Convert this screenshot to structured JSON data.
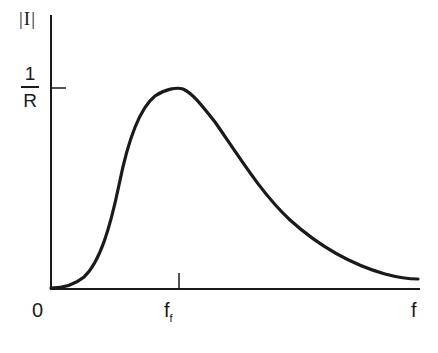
{
  "diagram": {
    "y_axis_label": "|I|",
    "y_tick_label": {
      "numerator": "1",
      "denominator": "R"
    },
    "x_origin_label": "0",
    "x_tick_label": {
      "base": "f",
      "subscript": "f"
    },
    "x_axis_label": "f",
    "curve_description": "Resonance curve: current magnitude vs frequency, peaking at 1/R at f = f_f",
    "colors": {
      "ink": "#1a1a1a",
      "background": "#ffffff"
    }
  }
}
